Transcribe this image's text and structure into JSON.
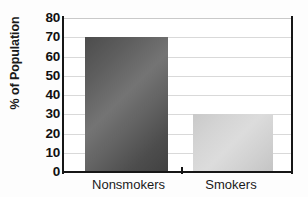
{
  "chart_data": {
    "type": "bar",
    "title": "",
    "xlabel": "",
    "ylabel": "% of Population",
    "categories": [
      "Nonsmokers",
      "Smokers"
    ],
    "values": [
      70,
      30
    ],
    "ylim": [
      0,
      80
    ],
    "ytick_step": 10,
    "ytick_labels": [
      "80",
      "70",
      "60",
      "50",
      "40",
      "30",
      "20",
      "10",
      "0"
    ],
    "ytick_values": [
      80,
      70,
      60,
      50,
      40,
      30,
      20,
      10,
      0
    ],
    "grid": true,
    "grid_axis": "y",
    "legend": false,
    "legend_position": "none",
    "bar_colors": [
      "#555555",
      "#d3d3d3"
    ],
    "axis_color": "#161616",
    "gridline_color": "#d9d9d9",
    "background_color": "#ffffff"
  },
  "axes": {
    "y_title": "% of Population",
    "y_ticks": [
      {
        "label": "80",
        "value": 80
      },
      {
        "label": "70",
        "value": 70
      },
      {
        "label": "60",
        "value": 60
      },
      {
        "label": "50",
        "value": 50
      },
      {
        "label": "40",
        "value": 40
      },
      {
        "label": "30",
        "value": 30
      },
      {
        "label": "20",
        "value": 20
      },
      {
        "label": "10",
        "value": 10
      },
      {
        "label": "0",
        "value": 0
      }
    ],
    "x_ticks": [
      {
        "label": "Nonsmokers",
        "value": 70
      },
      {
        "label": "Smokers",
        "value": 30
      }
    ]
  }
}
